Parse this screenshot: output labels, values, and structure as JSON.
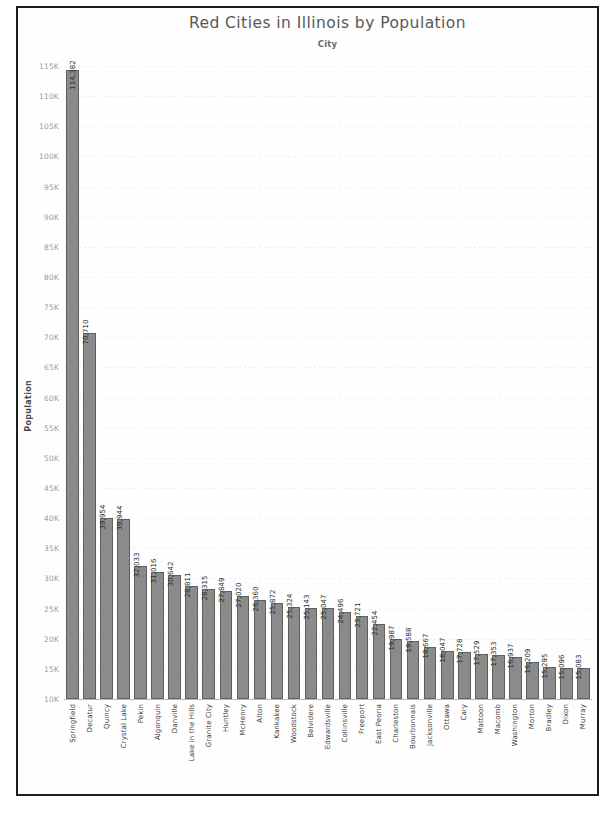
{
  "chart_data": {
    "type": "bar",
    "title": "Red Cities in Illinois by Population",
    "subtitle": "City",
    "xlabel": "City",
    "ylabel": "Population",
    "ylim": [
      10000,
      117000
    ],
    "grid": true,
    "legend": "none",
    "bar_color": "#8b8b8b",
    "ytick_labels": [
      "115K",
      "110K",
      "105K",
      "100K",
      "95K",
      "90K",
      "85K",
      "80K",
      "75K",
      "70K",
      "65K",
      "60K",
      "55K",
      "50K",
      "45K",
      "40K",
      "35K",
      "30K",
      "25K",
      "20K",
      "15K",
      "10K"
    ],
    "ytick_values": [
      115000,
      110000,
      105000,
      100000,
      95000,
      90000,
      85000,
      80000,
      75000,
      70000,
      65000,
      60000,
      55000,
      50000,
      45000,
      40000,
      35000,
      30000,
      25000,
      20000,
      15000,
      10000
    ],
    "categories": [
      "Springfield",
      "Decatur",
      "Quincy",
      "Crystal Lake",
      "Pekin",
      "Algonquin",
      "Danville",
      "Lake in the Hills",
      "Granite City",
      "Huntley",
      "McHenry",
      "Alton",
      "Kankakee",
      "Woodstock",
      "Belvidere",
      "Edwardsville",
      "Collinsville",
      "Freeport",
      "East Peoria",
      "Charleston",
      "Bourbonnais",
      "Jacksonville",
      "Ottawa",
      "Cary",
      "Mattoon",
      "Macomb",
      "Washington",
      "Morton",
      "Bradley",
      "Dixon",
      "Murray"
    ],
    "values": [
      114382,
      70710,
      39954,
      39944,
      32033,
      31016,
      30642,
      28811,
      28315,
      27849,
      27020,
      26360,
      25872,
      25324,
      25143,
      25047,
      24496,
      23721,
      22454,
      19987,
      19588,
      18667,
      18047,
      17728,
      17529,
      17353,
      16937,
      16209,
      15295,
      15096,
      15083
    ],
    "value_labels": [
      "114,382",
      "70,710",
      "39,954",
      "39,944",
      "32,033",
      "31,016",
      "30,642",
      "28,811",
      "28,315",
      "27,849",
      "27,020",
      "26,360",
      "25,872",
      "25,324",
      "25,143",
      "25,047",
      "24,496",
      "23,721",
      "22,454",
      "19,987",
      "19,588",
      "18,667",
      "18,047",
      "17,728",
      "17,529",
      "17,353",
      "16,937",
      "16,209",
      "15,295",
      "15,096",
      "15,083"
    ]
  },
  "axis": {
    "y_title": "Population"
  }
}
